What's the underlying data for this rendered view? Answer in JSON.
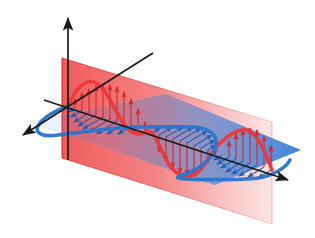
{
  "figure": {
    "background_color": "#ffffff",
    "width": 315,
    "height": 238
  },
  "colors": {
    "electric_red": "#ED3838",
    "electric_red_dark": "#D62828",
    "magnetic_blue": "#2C76CC",
    "magnetic_blue_dark": "#1F5FB0",
    "plane_red_fill": "#ED3838",
    "plane_blue_fill": "#3C7FD6",
    "axis_black": "#1A1A1A"
  },
  "axes": {
    "origin": {
      "x": 68,
      "y": 106
    },
    "vertical_axis": {
      "name": "vertical-axis",
      "from": {
        "x": 68,
        "y": 160
      },
      "to": {
        "x": 68,
        "y": 16
      },
      "arrowhead": "up"
    },
    "depth_axis": {
      "name": "depth-axis",
      "from": {
        "x": 153,
        "y": 53
      },
      "to": {
        "x": 20,
        "y": 137
      },
      "arrowhead": "down-left"
    },
    "propagation_axis": {
      "name": "propagation-axis",
      "from": {
        "x": 44,
        "y": 100
      },
      "to": {
        "x": 291,
        "y": 181
      },
      "arrowhead": "right"
    }
  },
  "planes": {
    "vertical_plane": {
      "name": "vertical-red-plane",
      "color": "#ED3838",
      "opacity_near": 0.78,
      "opacity_far": 0.16,
      "corners": [
        {
          "x": 62,
          "y": 58
        },
        {
          "x": 272,
          "y": 122
        },
        {
          "x": 272,
          "y": 224
        },
        {
          "x": 62,
          "y": 158
        }
      ]
    },
    "horizontal_plane": {
      "name": "horizontal-blue-plane",
      "color": "#3C7FD6",
      "opacity_near": 0.08,
      "opacity_far": 0.85,
      "corners": [
        {
          "x": 30,
          "y": 122
        },
        {
          "x": 166,
          "y": 94
        },
        {
          "x": 301,
          "y": 150
        },
        {
          "x": 215,
          "y": 185
        }
      ]
    }
  },
  "waves": {
    "electric": {
      "name": "electric-field-wave",
      "label": "E field (red)",
      "color": "#ED3838",
      "plane": "vertical",
      "cycles": 2,
      "amplitude_px": 40,
      "phase_deg": 0,
      "vector_count": 30,
      "vector_direction": "vertical"
    },
    "magnetic": {
      "name": "magnetic-field-wave",
      "label": "B field (blue)",
      "color": "#2C76CC",
      "plane": "horizontal",
      "cycles": 2,
      "amplitude_px": 46,
      "phase_deg": 0,
      "vector_count": 30,
      "vector_direction": "depth"
    }
  }
}
